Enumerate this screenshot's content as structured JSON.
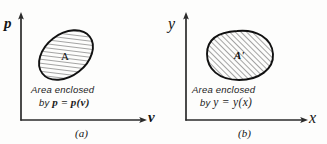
{
  "figure": {
    "background_color": "#fdfdfc",
    "ink_color": "#1a1a1a"
  },
  "panels": [
    {
      "id": "a",
      "subcaption": "(a)",
      "vertical_axis_label": "p",
      "horizontal_axis_label": "v",
      "region_label": "A",
      "caption_line1": "Area enclosed",
      "caption_line2_prefix": "by ",
      "caption_equation": "p = p(v)",
      "shape": "tilted-ellipse",
      "hatch_angle_deg": 45
    },
    {
      "id": "b",
      "subcaption": "(b)",
      "vertical_axis_label": "y",
      "horizontal_axis_label": "x",
      "region_label": "A'",
      "caption_line1": "Area enclosed",
      "caption_line2_prefix": "by ",
      "caption_equation": "y = y(x)",
      "shape": "rounded-blob",
      "hatch_angle_deg": 45
    }
  ]
}
